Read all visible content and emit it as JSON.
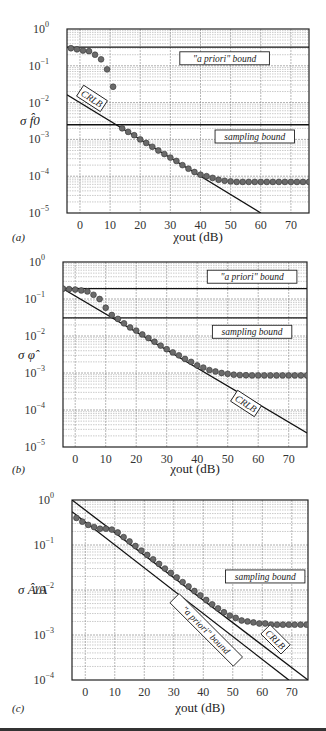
{
  "chart_data": [
    {
      "type": "scatter",
      "panel": "(a)",
      "xlabel": "χout (dB)",
      "ylabel": "σ f̂0",
      "yscale": "log",
      "xlim": [
        -4.3,
        76
      ],
      "ylim": [
        1e-05,
        1
      ],
      "xticks": [
        "0",
        "10",
        "20",
        "30",
        "40",
        "50",
        "60",
        "70"
      ],
      "yticks": [
        "10",
        "10",
        "10",
        "10",
        "10",
        "10"
      ],
      "ytick_exp": [
        "0",
        "−1",
        "−2",
        "−3",
        "−4",
        "−5"
      ],
      "grid": true,
      "series": [
        {
          "name": "simulation",
          "kind": "points",
          "x": [
            -3,
            -1,
            1,
            3,
            5,
            7,
            9,
            11,
            14,
            16,
            18,
            20,
            22,
            24,
            26,
            28,
            30,
            32,
            34,
            36,
            38,
            40,
            42,
            44,
            46,
            48,
            50,
            52,
            54,
            56,
            58,
            60,
            62,
            64,
            66,
            68,
            70,
            72,
            74,
            76
          ],
          "y": [
            0.3,
            0.28,
            0.26,
            0.25,
            0.2,
            0.15,
            0.08,
            0.027,
            0.002,
            0.0016,
            0.0013,
            0.001,
            0.0008,
            0.00063,
            0.0005,
            0.0004,
            0.00032,
            0.00026,
            0.0002,
            0.00016,
            0.00013,
            0.00011,
            0.0001,
            9e-05,
            8e-05,
            7.5e-05,
            7.2e-05,
            7e-05,
            7e-05,
            7e-05,
            7e-05,
            7e-05,
            7e-05,
            7e-05,
            7e-05,
            7e-05,
            7e-05,
            7e-05,
            7e-05,
            7e-05
          ]
        },
        {
          "name": "CRLB",
          "kind": "line",
          "x": [
            -4.3,
            60
          ],
          "y": [
            0.0164,
            1e-05
          ]
        },
        {
          "name": "a priori bound",
          "kind": "hline",
          "y": 0.32
        },
        {
          "name": "sampling bound",
          "kind": "hline",
          "y": 0.0025
        }
      ],
      "annotations": [
        {
          "text": "\"a priori\" bound",
          "x": 48,
          "y": 0.16,
          "rotate": 0
        },
        {
          "text": "sampling bound",
          "x": 58,
          "y": 0.0012,
          "rotate": 0
        },
        {
          "text": "CRLB",
          "x": 4,
          "y": 0.013,
          "rotate": 33
        }
      ]
    },
    {
      "type": "scatter",
      "panel": "(b)",
      "xlabel": "χout (dB)",
      "ylabel": "σ φ̂",
      "yscale": "log",
      "xlim": [
        -4,
        76
      ],
      "ylim": [
        1e-05,
        1
      ],
      "xticks": [
        "0",
        "10",
        "20",
        "30",
        "40",
        "50",
        "60",
        "70"
      ],
      "yticks": [
        "10",
        "10",
        "10",
        "10",
        "10",
        "10"
      ],
      "ytick_exp": [
        "0",
        "−1",
        "−2",
        "−3",
        "−4",
        "−5"
      ],
      "grid": true,
      "series": [
        {
          "name": "simulation",
          "kind": "points",
          "x": [
            -4,
            -2,
            0,
            2,
            4,
            6,
            8,
            10,
            12,
            14,
            16,
            18,
            20,
            22,
            24,
            26,
            28,
            30,
            32,
            34,
            36,
            38,
            40,
            42,
            44,
            46,
            48,
            50,
            52,
            54,
            56,
            58,
            60,
            62,
            64,
            66,
            68,
            70,
            72,
            74,
            76
          ],
          "y": [
            0.19,
            0.185,
            0.18,
            0.17,
            0.16,
            0.13,
            0.1,
            0.058,
            0.037,
            0.029,
            0.022,
            0.017,
            0.014,
            0.011,
            0.0088,
            0.007,
            0.0055,
            0.0044,
            0.0036,
            0.003,
            0.0024,
            0.002,
            0.0016,
            0.0014,
            0.0012,
            0.0011,
            0.001,
            0.00095,
            0.0009,
            0.00088,
            0.00087,
            0.00086,
            0.00086,
            0.00086,
            0.00086,
            0.00086,
            0.00086,
            0.00086,
            0.00086,
            0.00086,
            0.00086
          ]
        },
        {
          "name": "CRLB",
          "kind": "line",
          "x": [
            -4,
            76
          ],
          "y": [
            0.19,
            2.4e-05
          ]
        },
        {
          "name": "a priori bound",
          "kind": "hline",
          "y": 0.19
        },
        {
          "name": "sampling bound",
          "kind": "hline",
          "y": 0.031
        }
      ],
      "annotations": [
        {
          "text": "\"a priori\" bound",
          "x": 58,
          "y": 0.4,
          "rotate": 0
        },
        {
          "text": "sampling bound",
          "x": 58,
          "y": 0.013,
          "rotate": 0
        },
        {
          "text": "CRLB",
          "x": 56,
          "y": 0.00015,
          "rotate": 33
        }
      ]
    },
    {
      "type": "scatter",
      "panel": "(c)",
      "xlabel": "χout (dB)",
      "ylabel": "σ Â/A",
      "yscale": "log",
      "xlim": [
        -4.5,
        75.5
      ],
      "ylim": [
        0.0001,
        1
      ],
      "xticks": [
        "0",
        "10",
        "20",
        "30",
        "40",
        "50",
        "60",
        "70"
      ],
      "yticks": [
        "10",
        "10",
        "10",
        "10",
        "10"
      ],
      "ytick_exp": [
        "0",
        "−1",
        "−2",
        "−3",
        "−4"
      ],
      "grid": true,
      "series": [
        {
          "name": "simulation",
          "kind": "points",
          "x": [
            -3,
            -1,
            1,
            3,
            5,
            7,
            9,
            11,
            13,
            15,
            17,
            19,
            21,
            23,
            25,
            27,
            29,
            31,
            33,
            35,
            37,
            39,
            41,
            43,
            45,
            47,
            49,
            51,
            53,
            55,
            57,
            59,
            61,
            63,
            65,
            67,
            69,
            71,
            73,
            75
          ],
          "y": [
            0.4,
            0.33,
            0.28,
            0.25,
            0.23,
            0.23,
            0.22,
            0.19,
            0.15,
            0.12,
            0.095,
            0.075,
            0.06,
            0.048,
            0.038,
            0.03,
            0.024,
            0.019,
            0.015,
            0.012,
            0.0095,
            0.0076,
            0.006,
            0.0048,
            0.0039,
            0.0032,
            0.0027,
            0.0024,
            0.0021,
            0.002,
            0.0019,
            0.0018,
            0.0018,
            0.0017,
            0.0017,
            0.0017,
            0.0017,
            0.0017,
            0.0017,
            0.0017
          ]
        },
        {
          "name": "CRLB",
          "kind": "line",
          "x": [
            -4.5,
            75.5
          ],
          "y": [
            1.0,
            0.0001
          ]
        },
        {
          "name": "a priori bound",
          "kind": "line",
          "x": [
            -4.5,
            69
          ],
          "y": [
            0.55,
            0.0001
          ]
        }
      ],
      "annotations": [
        {
          "text": "sampling bound",
          "x": 61,
          "y": 0.02,
          "rotate": 0
        },
        {
          "text": "\"a priori\" bound",
          "x": 41,
          "y": 0.0013,
          "rotate": 45
        },
        {
          "text": "CRLB",
          "x": 64.5,
          "y": 0.0008,
          "rotate": 45
        }
      ]
    }
  ]
}
